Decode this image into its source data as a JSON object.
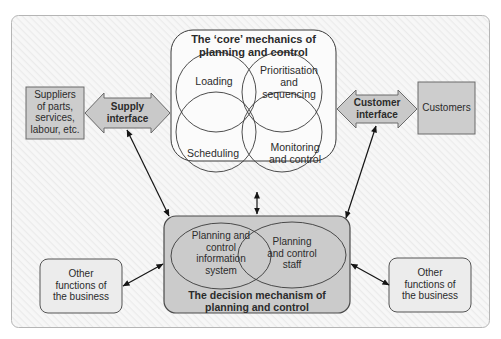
{
  "core": {
    "title_line1": "The ‘core’ mechanics of",
    "title_line2": "planning and control",
    "circles": [
      {
        "id": "loading",
        "label": [
          "Loading"
        ]
      },
      {
        "id": "prioritisation",
        "label": [
          "Prioritisation",
          "and",
          "sequencing"
        ]
      },
      {
        "id": "scheduling",
        "label": [
          "Scheduling"
        ]
      },
      {
        "id": "monitoring",
        "label": [
          "Monitoring",
          "and control"
        ]
      }
    ]
  },
  "suppliers": {
    "lines": [
      "Suppliers",
      "of parts,",
      "services,",
      "labour, etc."
    ]
  },
  "supply_interface": {
    "line1": "Supply",
    "line2": "interface"
  },
  "customer_interface": {
    "line1": "Customer",
    "line2": "interface"
  },
  "customers": {
    "label": "Customers"
  },
  "decision": {
    "title_line1": "The decision mechanism of",
    "title_line2": "planning and control",
    "ellipses": [
      {
        "id": "info-system",
        "label": [
          "Planning and",
          "control",
          "information",
          "system"
        ]
      },
      {
        "id": "staff",
        "label": [
          "Planning",
          "and control",
          "staff"
        ]
      }
    ]
  },
  "other_left": {
    "lines": [
      "Other",
      "functions of",
      "the business"
    ]
  },
  "other_right": {
    "lines": [
      "Other",
      "functions of",
      "the business"
    ]
  },
  "colors": {
    "box_gray": "#cfcfcf",
    "light_box": "#ececec",
    "interface_arrow": "#c8c8c8",
    "stroke": "#3a3a3a",
    "panel_bg": "#f2f2f2"
  }
}
